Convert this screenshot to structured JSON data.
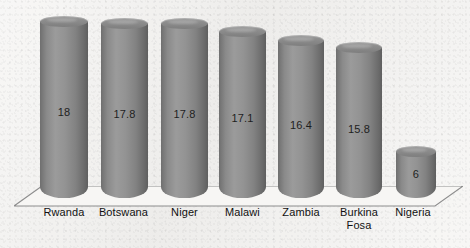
{
  "chart_data": {
    "type": "bar",
    "title": "",
    "subtitle": "",
    "xlabel": "",
    "ylabel": "",
    "grid": false,
    "legend": "none",
    "style": "3d-cylinder",
    "ylim": [
      0,
      20
    ],
    "categories": [
      "Rwanda",
      "Botswana",
      "Niger",
      "Malawi",
      "Zambia",
      "Burkina Fosa",
      "Nigeria"
    ],
    "values": [
      18,
      17.8,
      17.8,
      17.1,
      16.4,
      15.8,
      6
    ],
    "value_labels": [
      "18",
      "17.8",
      "17.8",
      "17.1",
      "16.4",
      "15.8",
      "6"
    ],
    "tick_labels": [],
    "annotations": []
  },
  "colors": {
    "bar_light": "#9b9b9b",
    "bar_mid": "#8a8a8a",
    "bar_dark": "#5f6060",
    "background": "#f3f2f0",
    "floor_fill": "#f6f5f3",
    "floor_stroke": "#8d8d8d",
    "label_text": "#111111",
    "value_text": "#1e1e1e"
  },
  "bars": [
    {
      "label": "Rwanda",
      "value_label": "18",
      "label_line2": "",
      "x": 40,
      "w": 48,
      "top": 16,
      "label_x": 30,
      "value_y": 106
    },
    {
      "label": "Botswana",
      "value_label": "17.8",
      "label_line2": "",
      "x": 101,
      "w": 47,
      "top": 18,
      "label_x": 90,
      "value_y": 108
    },
    {
      "label": "Niger",
      "value_label": "17.8",
      "label_line2": "",
      "x": 161,
      "w": 47,
      "top": 18,
      "label_x": 151,
      "value_y": 108
    },
    {
      "label": "Malawi",
      "value_label": "17.1",
      "label_line2": "",
      "x": 219,
      "w": 47,
      "top": 26,
      "label_x": 209,
      "value_y": 112
    },
    {
      "label": "Zambia",
      "value_label": "16.4",
      "label_line2": "",
      "x": 278,
      "w": 46,
      "top": 35,
      "label_x": 268,
      "value_y": 119
    },
    {
      "label": "Burkina",
      "value_label": "15.8",
      "label_line2": "Fosa",
      "x": 336,
      "w": 46,
      "top": 42,
      "label_x": 326,
      "value_y": 123
    },
    {
      "label": "Nigeria",
      "value_label": "6",
      "label_line2": "",
      "x": 396,
      "w": 40,
      "top": 146,
      "label_x": 383,
      "value_y": 168
    }
  ],
  "axis": {
    "baseline_y": 198,
    "label_row_y": 206
  }
}
